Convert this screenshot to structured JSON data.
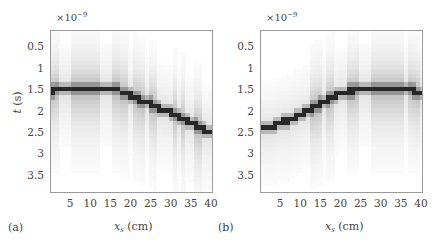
{
  "chart_data": [
    {
      "panel_label": "(a)",
      "type": "heatmap",
      "title": "",
      "xlabel": "x_s (cm)",
      "ylabel": "t (s)",
      "y_multiplier": "×10^-9",
      "x_ticks": [
        5,
        10,
        15,
        20,
        25,
        30,
        35,
        40
      ],
      "y_ticks": [
        0.5,
        1,
        1.5,
        2,
        2.5,
        3,
        3.5
      ],
      "xlim": [
        0,
        40
      ],
      "ylim": [
        3.9,
        0.1
      ],
      "colormap": "gray_r",
      "grid": false,
      "peak_track": {
        "x": [
          1,
          2,
          3,
          4,
          5,
          6,
          7,
          8,
          9,
          10,
          11,
          12,
          13,
          14,
          15,
          16,
          17,
          18,
          19,
          20,
          21,
          22,
          23,
          24,
          25,
          26,
          27,
          28,
          29,
          30,
          31,
          32,
          33,
          34,
          35,
          36,
          37,
          38,
          39,
          40
        ],
        "t": [
          1.5,
          1.45,
          1.45,
          1.45,
          1.45,
          1.45,
          1.45,
          1.45,
          1.45,
          1.45,
          1.45,
          1.45,
          1.45,
          1.45,
          1.45,
          1.45,
          1.45,
          1.55,
          1.55,
          1.6,
          1.65,
          1.7,
          1.75,
          1.75,
          1.8,
          1.85,
          1.9,
          1.95,
          1.95,
          2.0,
          2.05,
          2.1,
          2.15,
          2.2,
          2.25,
          2.3,
          2.35,
          2.4,
          2.45,
          2.45
        ]
      },
      "bright_columns": [
        1,
        2,
        6,
        7,
        8,
        9,
        10,
        11,
        12,
        16,
        17,
        18,
        19,
        21,
        22,
        23,
        25,
        26,
        31,
        33,
        36,
        37
      ]
    },
    {
      "panel_label": "(b)",
      "type": "heatmap",
      "title": "",
      "xlabel": "x_s (cm)",
      "ylabel": "",
      "y_multiplier": "×10^-9",
      "x_ticks": [
        5,
        10,
        15,
        20,
        25,
        30,
        35,
        40
      ],
      "y_ticks": [
        0.5,
        1,
        1.5,
        2,
        2.5,
        3,
        3.5
      ],
      "xlim": [
        0,
        40
      ],
      "ylim": [
        3.9,
        0.1
      ],
      "colormap": "gray_r",
      "grid": false,
      "peak_track": {
        "x": [
          1,
          2,
          3,
          4,
          5,
          6,
          7,
          8,
          9,
          10,
          11,
          12,
          13,
          14,
          15,
          16,
          17,
          18,
          19,
          20,
          21,
          22,
          23,
          24,
          25,
          26,
          27,
          28,
          29,
          30,
          31,
          32,
          33,
          34,
          35,
          36,
          37,
          38,
          39,
          40
        ],
        "t": [
          2.35,
          2.35,
          2.35,
          2.3,
          2.25,
          2.2,
          2.2,
          2.15,
          2.1,
          2.05,
          2.0,
          1.95,
          1.9,
          1.85,
          1.8,
          1.75,
          1.7,
          1.65,
          1.6,
          1.55,
          1.55,
          1.5,
          1.5,
          1.45,
          1.45,
          1.45,
          1.45,
          1.45,
          1.45,
          1.45,
          1.45,
          1.45,
          1.45,
          1.45,
          1.45,
          1.45,
          1.45,
          1.5,
          1.55,
          1.55
        ]
      },
      "bright_columns": [
        13,
        14,
        15,
        17,
        18,
        22,
        23,
        24,
        28,
        29,
        30,
        31,
        32,
        33,
        34,
        35,
        37,
        38,
        39
      ]
    }
  ],
  "panels": [
    {
      "label": "(a)",
      "exponent_base": "×10",
      "exponent_power": "−9",
      "ylabel_var": "t",
      "ylabel_unit": " (s)",
      "xlabel_var": "x",
      "xlabel_sub": "s",
      "xlabel_unit": " (cm)",
      "x_tick_labels": [
        "5",
        "10",
        "15",
        "20",
        "25",
        "30",
        "35",
        "40"
      ],
      "y_tick_labels": [
        "0.5",
        "1",
        "1.5",
        "2",
        "2.5",
        "3",
        "3.5"
      ]
    },
    {
      "label": "(b)",
      "exponent_base": "×10",
      "exponent_power": "−9",
      "ylabel_var": "",
      "ylabel_unit": "",
      "xlabel_var": "x",
      "xlabel_sub": "s",
      "xlabel_unit": " (cm)",
      "x_tick_labels": [
        "5",
        "10",
        "15",
        "20",
        "25",
        "30",
        "35",
        "40"
      ],
      "y_tick_labels": [
        "0.5",
        "1",
        "1.5",
        "2",
        "2.5",
        "3",
        "3.5"
      ]
    }
  ],
  "colors": {
    "peak": "#1a1a1a",
    "frame": "#9a9a9a",
    "background": "#ffffff"
  }
}
